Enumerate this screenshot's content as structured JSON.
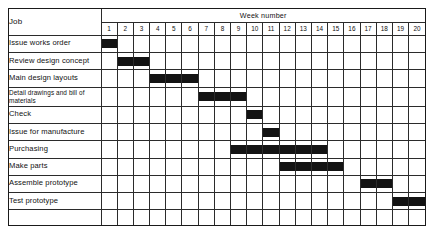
{
  "chart_data": {
    "type": "bar",
    "subtype": "gantt",
    "title": "",
    "xlabel": "Week number",
    "ylabel": "Job",
    "x_axis_label": "Week number",
    "y_axis_label": "Job",
    "grid": true,
    "legend": null,
    "week_numbers": [
      1,
      2,
      3,
      4,
      5,
      6,
      7,
      8,
      9,
      10,
      11,
      12,
      13,
      14,
      15,
      16,
      17,
      18,
      19,
      20
    ],
    "xlim": [
      1,
      20
    ],
    "bar_color": "#131313",
    "categories": [
      "Issue works order",
      "Review design concept",
      "Main design layouts",
      "Detail drawings and bill of materials",
      "Check",
      "Issue for manufacture",
      "Purchasing",
      "Make parts",
      "Assemble prototype",
      "Test prototype"
    ],
    "tasks": [
      {
        "label": "Issue works order",
        "start_week": 1,
        "end_week": 1,
        "duration": 1
      },
      {
        "label": "Review design concept",
        "start_week": 2,
        "end_week": 3,
        "duration": 2
      },
      {
        "label": "Main design layouts",
        "start_week": 4,
        "end_week": 6,
        "duration": 3
      },
      {
        "label": "Detail drawings and bill of materials",
        "start_week": 7,
        "end_week": 9,
        "duration": 3
      },
      {
        "label": "Check",
        "start_week": 10,
        "end_week": 10,
        "duration": 1
      },
      {
        "label": "Issue for manufacture",
        "start_week": 11,
        "end_week": 11,
        "duration": 1
      },
      {
        "label": "Purchasing",
        "start_week": 9,
        "end_week": 14,
        "duration": 6
      },
      {
        "label": "Make parts",
        "start_week": 12,
        "end_week": 15,
        "duration": 4
      },
      {
        "label": "Assemble prototype",
        "start_week": 17,
        "end_week": 18,
        "duration": 2
      },
      {
        "label": "Test prototype",
        "start_week": 19,
        "end_week": 20,
        "duration": 2
      }
    ]
  },
  "table": {
    "job_column_header": "Job",
    "week_group_header": "Week number",
    "rows": [
      {
        "label": "Issue works order",
        "two_line": false,
        "start_week": 1,
        "end_week": 1
      },
      {
        "label": "Review design concept",
        "two_line": false,
        "start_week": 2,
        "end_week": 3
      },
      {
        "label": "Main design layouts",
        "two_line": false,
        "start_week": 4,
        "end_week": 6
      },
      {
        "label": "Detail drawings and bill of materials",
        "two_line": true,
        "start_week": 7,
        "end_week": 9
      },
      {
        "label": "Check",
        "two_line": false,
        "start_week": 10,
        "end_week": 10
      },
      {
        "label": "Issue for manufacture",
        "two_line": false,
        "start_week": 11,
        "end_week": 11
      },
      {
        "label": "Purchasing",
        "two_line": false,
        "start_week": 9,
        "end_week": 14
      },
      {
        "label": "Make parts",
        "two_line": false,
        "start_week": 12,
        "end_week": 15
      },
      {
        "label": "Assemble prototype",
        "two_line": false,
        "start_week": 17,
        "end_week": 18
      },
      {
        "label": "Test prototype",
        "two_line": false,
        "start_week": 19,
        "end_week": 20
      },
      {
        "label": "",
        "two_line": false,
        "start_week": 0,
        "end_week": 0
      }
    ]
  },
  "colors": {
    "bar": "#131313",
    "grid_line": "#2b2b2b",
    "frame": "#1a1a1a",
    "background": "#ffffff",
    "text": "#111111"
  }
}
